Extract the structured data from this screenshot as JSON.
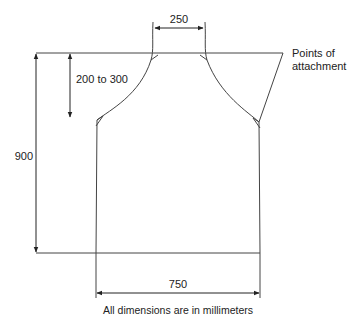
{
  "diagram": {
    "colors": {
      "line": "#444444",
      "text": "#222222",
      "background": "#ffffff"
    },
    "labels": {
      "neck_width": "250",
      "armhole_depth": "200 to 300",
      "total_length": "900",
      "body_width": "750",
      "attachment_line1": "Points of",
      "attachment_line2": "attachment",
      "footer": "All dimensions are in millimeters"
    }
  }
}
